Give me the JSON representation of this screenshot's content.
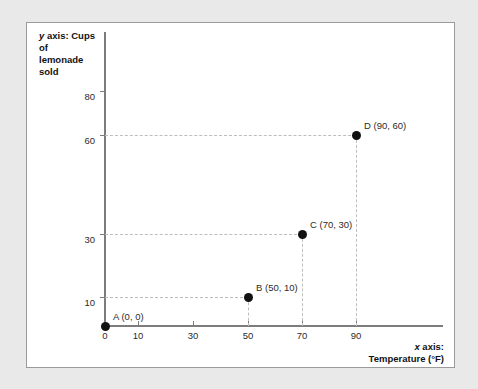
{
  "chart_data": {
    "type": "scatter",
    "title": "",
    "xlabel": "x axis: Temperature (°F)",
    "ylabel": "y axis: Cups of lemonade sold",
    "xlabel_axis_prefix": "x axis:",
    "xlabel_axis_name": "Temperature (°F)",
    "ylabel_axis_prefix": "y axis: Cups of",
    "ylabel_axis_name": "lemonade sold",
    "x_ticks": [
      0,
      10,
      30,
      50,
      70,
      90
    ],
    "y_ticks": [
      10,
      30,
      60,
      80
    ],
    "xlim": [
      0,
      110
    ],
    "ylim": [
      0,
      90
    ],
    "grid": false,
    "legend": "none",
    "guide_lines": "dashed",
    "points": [
      {
        "name": "A",
        "x": 0,
        "y": 0,
        "label": "A (0, 0)",
        "guides": false
      },
      {
        "name": "B",
        "x": 50,
        "y": 10,
        "label": "B (50, 10)",
        "guides": true
      },
      {
        "name": "C",
        "x": 70,
        "y": 30,
        "label": "C (70, 30)",
        "guides": true
      },
      {
        "name": "D",
        "x": 90,
        "y": 60,
        "label": "D (90, 60)",
        "guides": true
      }
    ]
  },
  "colors": {
    "page_background": "#e9e9e9",
    "card_background": "#ffffff",
    "card_border": "#9a9a9a",
    "axis": "#7c7c7c",
    "guide": "#bdbdbd",
    "point": "#111111",
    "text": "#2b2b2b"
  },
  "axis_titles": {
    "y_line1": "y axis: Cups of",
    "y_line2": "lemonade sold",
    "y_italic_token": "y",
    "y_rest_line1": " axis: Cups of",
    "x_line1": "x axis:",
    "x_line2": "Temperature (°F)",
    "x_italic_token": "x",
    "x_rest_line1": " axis:"
  },
  "tick_labels": {
    "x": [
      "0",
      "10",
      "30",
      "50",
      "70",
      "90"
    ],
    "y": [
      "10",
      "30",
      "60",
      "80"
    ]
  }
}
